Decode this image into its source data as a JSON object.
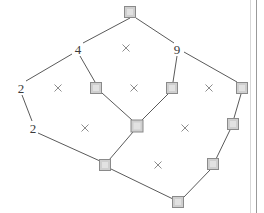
{
  "figure": {
    "type": "node-link-diagram",
    "background_color": "#ffffff",
    "width": 264,
    "height": 213,
    "node_fill": "#cfcfcf",
    "node_stroke": "#8a8a8a",
    "edge_color": "#5a5a5a",
    "cross_color": "#8c8c8c",
    "label_color": "#3a3a3a"
  },
  "nodes": [
    {
      "id": "n-top",
      "name": "node-top",
      "x": 130,
      "y": 12,
      "size": 11
    },
    {
      "id": "n-mid-left",
      "name": "node-mid-left",
      "x": 96,
      "y": 88,
      "size": 11
    },
    {
      "id": "n-mid-right",
      "name": "node-mid-right",
      "x": 172,
      "y": 88,
      "size": 11
    },
    {
      "id": "n-far-right",
      "name": "node-far-right",
      "x": 242,
      "y": 88,
      "size": 11
    },
    {
      "id": "n-center",
      "name": "node-center",
      "x": 137,
      "y": 126,
      "size": 12
    },
    {
      "id": "n-right-upper",
      "name": "node-right-upper",
      "x": 233,
      "y": 124,
      "size": 11
    },
    {
      "id": "n-bottom-left",
      "name": "node-bottom-left",
      "x": 105,
      "y": 165,
      "size": 11
    },
    {
      "id": "n-right-lower",
      "name": "node-right-lower",
      "x": 213,
      "y": 164,
      "size": 11
    },
    {
      "id": "n-bottom",
      "name": "node-bottom",
      "x": 178,
      "y": 202,
      "size": 11
    }
  ],
  "labeled_vertices": [
    {
      "id": "v-4",
      "name": "vertex-label-4",
      "label": "4",
      "x": 78,
      "y": 49
    },
    {
      "id": "v-9",
      "name": "vertex-label-9",
      "label": "9",
      "x": 177,
      "y": 49
    },
    {
      "id": "v-2-upper",
      "name": "vertex-label-2-upper",
      "label": "2",
      "x": 21,
      "y": 88
    },
    {
      "id": "v-2-lower",
      "name": "vertex-label-2-lower",
      "label": "2",
      "x": 33,
      "y": 128
    }
  ],
  "edges": [
    {
      "name": "edge-top-to-4",
      "x1": 130,
      "y1": 18,
      "x2": 83,
      "y2": 43
    },
    {
      "name": "edge-top-to-9",
      "x1": 136,
      "y1": 18,
      "x2": 174,
      "y2": 43
    },
    {
      "name": "edge-4-to-2-upper",
      "x1": 72,
      "y1": 54,
      "x2": 26,
      "y2": 81
    },
    {
      "name": "edge-4-to-mid-left",
      "x1": 80,
      "y1": 56,
      "x2": 95,
      "y2": 82
    },
    {
      "name": "edge-9-to-mid-right",
      "x1": 177,
      "y1": 56,
      "x2": 173,
      "y2": 82
    },
    {
      "name": "edge-9-to-far-right",
      "x1": 184,
      "y1": 52,
      "x2": 237,
      "y2": 82
    },
    {
      "name": "edge-2-upper-to-2-lower",
      "x1": 22,
      "y1": 95,
      "x2": 32,
      "y2": 121
    },
    {
      "name": "edge-mid-left-to-center",
      "x1": 102,
      "y1": 93,
      "x2": 132,
      "y2": 120
    },
    {
      "name": "edge-mid-right-to-center",
      "x1": 168,
      "y1": 94,
      "x2": 142,
      "y2": 120
    },
    {
      "name": "edge-far-right-to-right-upper",
      "x1": 241,
      "y1": 94,
      "x2": 234,
      "y2": 118
    },
    {
      "name": "edge-2-lower-to-bottom-left",
      "x1": 38,
      "y1": 133,
      "x2": 100,
      "y2": 161
    },
    {
      "name": "edge-center-to-bottom-left",
      "x1": 133,
      "y1": 132,
      "x2": 109,
      "y2": 160
    },
    {
      "name": "edge-right-upper-to-right-lower",
      "x1": 230,
      "y1": 130,
      "x2": 216,
      "y2": 159
    },
    {
      "name": "edge-bottom-left-to-bottom",
      "x1": 111,
      "y1": 169,
      "x2": 173,
      "y2": 199
    },
    {
      "name": "edge-right-lower-to-bottom",
      "x1": 210,
      "y1": 170,
      "x2": 183,
      "y2": 198
    }
  ],
  "cross_marks": [
    {
      "name": "cross-mark-top-center",
      "x": 126,
      "y": 48
    },
    {
      "name": "cross-mark-left-upper",
      "x": 58,
      "y": 88
    },
    {
      "name": "cross-mark-center-upper",
      "x": 134,
      "y": 88
    },
    {
      "name": "cross-mark-right-upper",
      "x": 209,
      "y": 88
    },
    {
      "name": "cross-mark-left-lower",
      "x": 85,
      "y": 128
    },
    {
      "name": "cross-mark-right-lower",
      "x": 185,
      "y": 128
    },
    {
      "name": "cross-mark-bottom-center",
      "x": 158,
      "y": 165
    }
  ],
  "borders": {
    "panel_edge_x": 250,
    "right_border_x": 256
  }
}
